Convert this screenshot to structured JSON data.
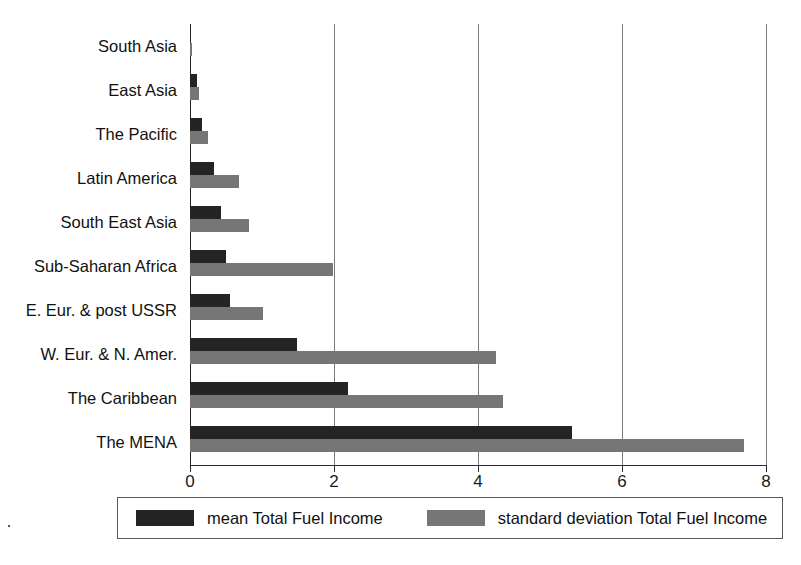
{
  "chart_data": {
    "type": "bar",
    "orientation": "horizontal",
    "title": "",
    "subtitle": "",
    "xlabel": "",
    "ylabel": "",
    "xlim": [
      0,
      8
    ],
    "xticks": [
      "0",
      "2",
      "4",
      "6",
      "8"
    ],
    "xtick_values": [
      0,
      2,
      4,
      6,
      8
    ],
    "grid": true,
    "legend_position": "bottom",
    "categories": [
      "South Asia",
      "East Asia",
      "The Pacific",
      "Latin America",
      "South East Asia",
      "Sub-Saharan Africa",
      "E. Eur. & post USSR",
      "W. Eur. & N. Amer.",
      "The Caribbean",
      "The MENA"
    ],
    "series": [
      {
        "name": "mean Total Fuel Income",
        "color": "#242424",
        "values": [
          0.02,
          0.1,
          0.17,
          0.33,
          0.43,
          0.5,
          0.56,
          1.48,
          2.2,
          5.3
        ]
      },
      {
        "name": "standard deviation Total Fuel Income",
        "color": "#767676",
        "values": [
          0.03,
          0.13,
          0.25,
          0.68,
          0.82,
          1.98,
          1.02,
          4.25,
          4.35,
          7.7
        ]
      }
    ]
  },
  "legend": {
    "items": [
      {
        "label": "mean Total Fuel Income",
        "color": "#242424"
      },
      {
        "label": "standard deviation Total Fuel Income",
        "color": "#767676"
      }
    ]
  },
  "caption": {
    "text": ""
  }
}
